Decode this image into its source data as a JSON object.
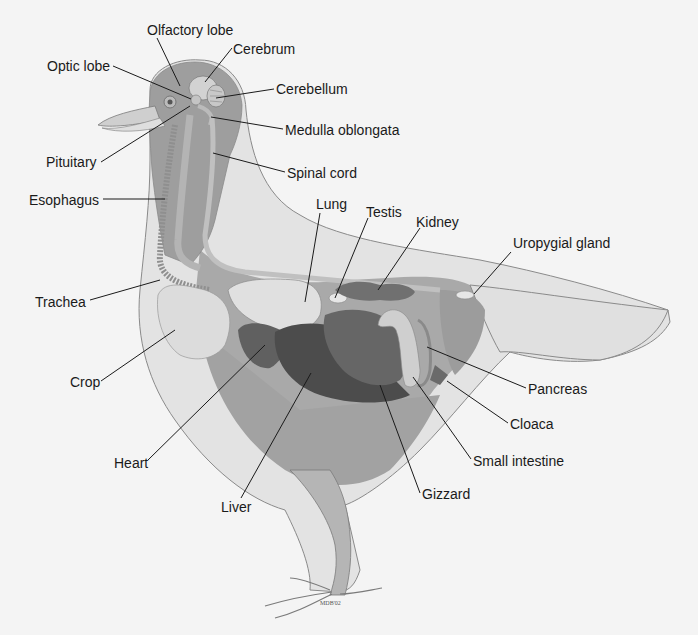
{
  "diagram": {
    "signature": "MDB'02",
    "colors": {
      "background": "#f4f4f4",
      "outer_body": "#dadada",
      "body_cavity": "#a8a8a8",
      "head": "#9e9e9e",
      "dark_organs": "#5a5a5a",
      "light_organs": "#d8d8d8",
      "leader_line": "#1a1a1a"
    },
    "labels": [
      {
        "id": "olfactory-lobe",
        "text": "Olfactory lobe",
        "x": 147,
        "y": 22
      },
      {
        "id": "cerebrum",
        "text": "Cerebrum",
        "x": 233,
        "y": 41
      },
      {
        "id": "optic-lobe",
        "text": "Optic lobe",
        "x": 47,
        "y": 58
      },
      {
        "id": "cerebellum",
        "text": "Cerebellum",
        "x": 276,
        "y": 81
      },
      {
        "id": "medulla-oblongata",
        "text": "Medulla oblongata",
        "x": 285,
        "y": 122
      },
      {
        "id": "pituitary",
        "text": "Pituitary",
        "x": 46,
        "y": 154
      },
      {
        "id": "spinal-cord",
        "text": "Spinal cord",
        "x": 287,
        "y": 165
      },
      {
        "id": "esophagus",
        "text": "Esophagus",
        "x": 29,
        "y": 192
      },
      {
        "id": "lung",
        "text": "Lung",
        "x": 316,
        "y": 196
      },
      {
        "id": "testis",
        "text": "Testis",
        "x": 366,
        "y": 204
      },
      {
        "id": "kidney",
        "text": "Kidney",
        "x": 416,
        "y": 214
      },
      {
        "id": "uropygial-gland",
        "text": "Uropygial gland",
        "x": 513,
        "y": 235
      },
      {
        "id": "trachea",
        "text": "Trachea",
        "x": 35,
        "y": 294
      },
      {
        "id": "crop",
        "text": "Crop",
        "x": 70,
        "y": 374
      },
      {
        "id": "pancreas",
        "text": "Pancreas",
        "x": 528,
        "y": 381
      },
      {
        "id": "cloaca",
        "text": "Cloaca",
        "x": 510,
        "y": 416
      },
      {
        "id": "heart",
        "text": "Heart",
        "x": 114,
        "y": 455
      },
      {
        "id": "small-intestine",
        "text": "Small intestine",
        "x": 473,
        "y": 453
      },
      {
        "id": "gizzard",
        "text": "Gizzard",
        "x": 422,
        "y": 486
      },
      {
        "id": "liver",
        "text": "Liver",
        "x": 221,
        "y": 499
      }
    ]
  }
}
